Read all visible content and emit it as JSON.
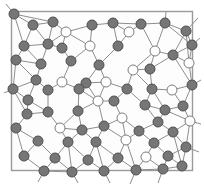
{
  "figure": {
    "type": "node-link-diagram",
    "background_color": "#ffffff",
    "canvas": {
      "width": 204,
      "height": 185
    }
  },
  "frame": {
    "name": "plot-frame",
    "x": 11.5,
    "y": 11.5,
    "width": 181,
    "height": 159,
    "stroke_color": "#9a9a9a",
    "stroke_width": 1.4,
    "fill_color": "#fdfdfd"
  },
  "style": {
    "filled_node_fill": "#767676",
    "filled_node_stroke": "#4f4f4f",
    "open_node_fill": "#ffffff",
    "open_node_stroke": "#7d7d7d",
    "node_radius": 5.0,
    "node_stroke_width": 1.0,
    "edge_color": "#8e8e8e",
    "edge_width": 1.0
  },
  "legend": {
    "filled_label": "filled node",
    "open_label": "open node"
  },
  "chart_data": {
    "type": "scatter",
    "xlabel": "",
    "ylabel": "",
    "xlim": [
      0,
      204
    ],
    "ylim": [
      0,
      185
    ],
    "grid": false,
    "legend_position": "none",
    "counts": {
      "filled": 96,
      "open": 21,
      "edges": 212
    },
    "nodes": [
      {
        "id": 0,
        "x": 14,
        "y": 14,
        "state": "filled"
      },
      {
        "id": 1,
        "x": 33,
        "y": 25,
        "state": "filled"
      },
      {
        "id": 2,
        "x": 53,
        "y": 22,
        "state": "filled"
      },
      {
        "id": 3,
        "x": 66,
        "y": 32,
        "state": "open"
      },
      {
        "id": 4,
        "x": 92,
        "y": 25,
        "state": "filled"
      },
      {
        "id": 5,
        "x": 113,
        "y": 23,
        "state": "filled"
      },
      {
        "id": 6,
        "x": 129,
        "y": 32,
        "state": "open"
      },
      {
        "id": 7,
        "x": 141,
        "y": 24,
        "state": "filled"
      },
      {
        "id": 8,
        "x": 165,
        "y": 23,
        "state": "filled"
      },
      {
        "id": 9,
        "x": 186,
        "y": 31,
        "state": "filled"
      },
      {
        "id": 10,
        "x": 24,
        "y": 46,
        "state": "filled"
      },
      {
        "id": 11,
        "x": 48,
        "y": 44,
        "state": "filled"
      },
      {
        "id": 12,
        "x": 62,
        "y": 48,
        "state": "filled"
      },
      {
        "id": 13,
        "x": 90,
        "y": 46,
        "state": "open"
      },
      {
        "id": 14,
        "x": 118,
        "y": 46,
        "state": "filled"
      },
      {
        "id": 15,
        "x": 155,
        "y": 51,
        "state": "open"
      },
      {
        "id": 16,
        "x": 173,
        "y": 55,
        "state": "filled"
      },
      {
        "id": 17,
        "x": 192,
        "y": 45,
        "state": "filled"
      },
      {
        "id": 18,
        "x": 16,
        "y": 60,
        "state": "filled"
      },
      {
        "id": 19,
        "x": 41,
        "y": 64,
        "state": "filled"
      },
      {
        "id": 20,
        "x": 71,
        "y": 61,
        "state": "filled"
      },
      {
        "id": 21,
        "x": 99,
        "y": 65,
        "state": "filled"
      },
      {
        "id": 22,
        "x": 133,
        "y": 70,
        "state": "open"
      },
      {
        "id": 23,
        "x": 150,
        "y": 69,
        "state": "filled"
      },
      {
        "id": 24,
        "x": 189,
        "y": 63,
        "state": "open"
      },
      {
        "id": 25,
        "x": 36,
        "y": 80,
        "state": "filled"
      },
      {
        "id": 26,
        "x": 62,
        "y": 82,
        "state": "open"
      },
      {
        "id": 27,
        "x": 86,
        "y": 83,
        "state": "filled"
      },
      {
        "id": 28,
        "x": 106,
        "y": 82,
        "state": "open"
      },
      {
        "id": 29,
        "x": 13,
        "y": 89,
        "state": "filled"
      },
      {
        "id": 30,
        "x": 48,
        "y": 90,
        "state": "filled"
      },
      {
        "id": 31,
        "x": 79,
        "y": 89,
        "state": "filled"
      },
      {
        "id": 32,
        "x": 127,
        "y": 89,
        "state": "filled"
      },
      {
        "id": 33,
        "x": 152,
        "y": 89,
        "state": "filled"
      },
      {
        "id": 34,
        "x": 172,
        "y": 90,
        "state": "open"
      },
      {
        "id": 35,
        "x": 192,
        "y": 85,
        "state": "filled"
      },
      {
        "id": 36,
        "x": 28,
        "y": 100,
        "state": "filled"
      },
      {
        "id": 37,
        "x": 98,
        "y": 101,
        "state": "open"
      },
      {
        "id": 38,
        "x": 114,
        "y": 101,
        "state": "filled"
      },
      {
        "id": 39,
        "x": 145,
        "y": 105,
        "state": "filled"
      },
      {
        "id": 40,
        "x": 165,
        "y": 110,
        "state": "filled"
      },
      {
        "id": 41,
        "x": 183,
        "y": 106,
        "state": "filled"
      },
      {
        "id": 42,
        "x": 27,
        "y": 114,
        "state": "filled"
      },
      {
        "id": 43,
        "x": 48,
        "y": 112,
        "state": "filled"
      },
      {
        "id": 44,
        "x": 78,
        "y": 111,
        "state": "filled"
      },
      {
        "id": 45,
        "x": 122,
        "y": 118,
        "state": "open"
      },
      {
        "id": 46,
        "x": 158,
        "y": 122,
        "state": "filled"
      },
      {
        "id": 47,
        "x": 190,
        "y": 121,
        "state": "open"
      },
      {
        "id": 48,
        "x": 16,
        "y": 128,
        "state": "filled"
      },
      {
        "id": 49,
        "x": 60,
        "y": 128,
        "state": "open"
      },
      {
        "id": 50,
        "x": 82,
        "y": 130,
        "state": "filled"
      },
      {
        "id": 51,
        "x": 104,
        "y": 126,
        "state": "filled"
      },
      {
        "id": 52,
        "x": 139,
        "y": 131,
        "state": "filled"
      },
      {
        "id": 53,
        "x": 173,
        "y": 132,
        "state": "filled"
      },
      {
        "id": 54,
        "x": 38,
        "y": 141,
        "state": "filled"
      },
      {
        "id": 55,
        "x": 68,
        "y": 142,
        "state": "filled"
      },
      {
        "id": 56,
        "x": 96,
        "y": 142,
        "state": "filled"
      },
      {
        "id": 57,
        "x": 126,
        "y": 140,
        "state": "open"
      },
      {
        "id": 58,
        "x": 154,
        "y": 143,
        "state": "filled"
      },
      {
        "id": 59,
        "x": 186,
        "y": 147,
        "state": "filled"
      },
      {
        "id": 60,
        "x": 24,
        "y": 156,
        "state": "filled"
      },
      {
        "id": 61,
        "x": 55,
        "y": 158,
        "state": "filled"
      },
      {
        "id": 62,
        "x": 88,
        "y": 160,
        "state": "filled"
      },
      {
        "id": 63,
        "x": 118,
        "y": 158,
        "state": "filled"
      },
      {
        "id": 64,
        "x": 146,
        "y": 157,
        "state": "open"
      },
      {
        "id": 65,
        "x": 168,
        "y": 156,
        "state": "filled"
      },
      {
        "id": 66,
        "x": 44,
        "y": 171,
        "state": "filled"
      },
      {
        "id": 67,
        "x": 72,
        "y": 172,
        "state": "filled"
      },
      {
        "id": 68,
        "x": 104,
        "y": 171,
        "state": "filled"
      },
      {
        "id": 69,
        "x": 136,
        "y": 170,
        "state": "filled"
      },
      {
        "id": 70,
        "x": 163,
        "y": 169,
        "state": "filled"
      },
      {
        "id": 71,
        "x": 182,
        "y": 166,
        "state": "filled"
      }
    ]
  }
}
